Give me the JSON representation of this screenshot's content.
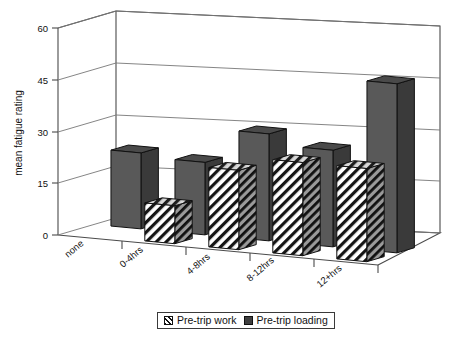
{
  "chart_data": {
    "type": "bar",
    "title": "",
    "subtitle": "",
    "xlabel": "",
    "ylabel": "mean fatigue rating",
    "categories": [
      "none",
      "0-4hrs",
      "4-8hrs",
      "8-12hrs",
      "12+hrs"
    ],
    "ylim": [
      0,
      60
    ],
    "yticks": [
      0,
      15,
      30,
      45,
      60
    ],
    "ytick_labels": [
      "0",
      "15",
      "30",
      "45",
      "60"
    ],
    "grid": true,
    "three_d": true,
    "legend_position": "bottom",
    "series": [
      {
        "name": "Pre-trip work",
        "style": "diagonal-hatch",
        "color": "#ffffff",
        "values": [
          0,
          11,
          23,
          27,
          27
        ]
      },
      {
        "name": "Pre-trip loading",
        "style": "solid-dark",
        "color": "#595959",
        "values": [
          22,
          21,
          31,
          28,
          49
        ]
      }
    ]
  },
  "legend": {
    "items": [
      {
        "label": "Pre-trip work",
        "swatch": "hatch-swatch-icon"
      },
      {
        "label": "Pre-trip loading",
        "swatch": "dark-swatch-icon"
      }
    ]
  },
  "axes": {
    "y_title": "mean fatigue rating",
    "y_tick_labels": [
      "60",
      "45",
      "30",
      "15",
      "0"
    ],
    "x_tick_labels": [
      "none",
      "0-4hrs",
      "4-8hrs",
      "8-12hrs",
      "12+hrs"
    ]
  }
}
